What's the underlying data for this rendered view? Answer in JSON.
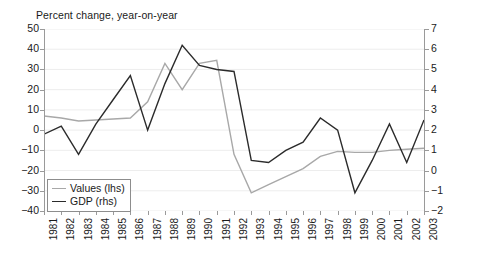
{
  "chart_data": {
    "type": "line",
    "title": "Percent change, year-on-year",
    "subtitle": "",
    "xlabel": "",
    "ylabel": "",
    "grid": true,
    "legend_position": "lower-left",
    "x": [
      1981,
      1982,
      1983,
      1984,
      1985,
      1986,
      1987,
      1988,
      1989,
      1990,
      1991,
      1992,
      1993,
      1994,
      1995,
      1996,
      1997,
      1998,
      1999,
      2000,
      2001,
      2002,
      2003
    ],
    "xtick_labels": [
      "1981",
      "1982",
      "1983",
      "1984",
      "1985",
      "1986",
      "1987",
      "1988",
      "1989",
      "1990",
      "1991",
      "1992",
      "1993",
      "1994",
      "1995",
      "1996",
      "1997",
      "1998",
      "1999",
      "2000",
      "2001",
      "2002",
      "2003"
    ],
    "axes": {
      "left": {
        "name": "lhs",
        "ylim": [
          -40,
          50
        ],
        "ticks": [
          -40,
          -30,
          -20,
          -10,
          0,
          10,
          20,
          30,
          40,
          50
        ],
        "tick_labels": [
          "−40",
          "−30",
          "−20",
          "−10",
          "0",
          "10",
          "20",
          "30",
          "40",
          "50"
        ]
      },
      "right": {
        "name": "rhs",
        "ylim": [
          -2,
          7
        ],
        "ticks": [
          -2,
          -1,
          0,
          1,
          2,
          3,
          4,
          5,
          6,
          7
        ],
        "tick_labels": [
          "−2",
          "−1",
          "0",
          "1",
          "2",
          "3",
          "4",
          "5",
          "6",
          "7"
        ]
      }
    },
    "series": [
      {
        "name": "Values (lhs)",
        "axis": "left",
        "color": "#a8a8a8",
        "width": 1.4,
        "values": [
          7,
          6,
          4.5,
          5,
          5.5,
          6,
          14,
          33,
          20,
          33,
          34.5,
          -12,
          -31,
          -27,
          -23,
          -19,
          -13,
          -10.5,
          -11,
          -11,
          -10,
          -9.5,
          -9
        ]
      },
      {
        "name": "GDP (rhs)",
        "axis": "right",
        "color": "#2b2b2b",
        "width": 1.4,
        "values": [
          1.8,
          2.2,
          0.8,
          2.3,
          3.5,
          4.7,
          2.0,
          4.3,
          6.2,
          5.2,
          5.0,
          4.9,
          0.5,
          0.4,
          1.0,
          1.4,
          2.6,
          2.0,
          -1.1,
          0.5,
          2.3,
          0.4,
          2.5
        ]
      }
    ],
    "legend_entries": [
      {
        "label": "Values (lhs)",
        "color": "#a8a8a8",
        "width": 1.4
      },
      {
        "label": "GDP (rhs)",
        "color": "#2b2b2b",
        "width": 1.9
      }
    ]
  }
}
